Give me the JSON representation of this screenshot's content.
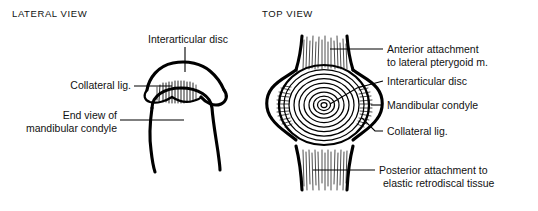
{
  "figure": {
    "background_color": "#ffffff",
    "ink_color": "#000000",
    "width": 538,
    "height": 211
  },
  "panels": [
    {
      "id": "lateral",
      "heading": "LATERAL VIEW",
      "labels": [
        {
          "id": "interarticular-disc",
          "text": "Interarticular disc"
        },
        {
          "id": "collateral-lig",
          "text": "Collateral lig."
        },
        {
          "id": "end-view-line1",
          "text": "End view of"
        },
        {
          "id": "end-view-line2",
          "text": "mandibular condyle"
        }
      ]
    },
    {
      "id": "top",
      "heading": "TOP VIEW",
      "labels": [
        {
          "id": "anterior-attachment-line1",
          "text": "Anterior attachment"
        },
        {
          "id": "anterior-attachment-line2",
          "text": "to lateral pterygoid m."
        },
        {
          "id": "interarticular-disc",
          "text": "Interarticular disc"
        },
        {
          "id": "mandibular-condyle",
          "text": "Mandibular condyle"
        },
        {
          "id": "collateral-lig",
          "text": "Collateral lig."
        },
        {
          "id": "posterior-attachment-line1",
          "text": "Posterior attachment to"
        },
        {
          "id": "posterior-attachment-line2",
          "text": "elastic retrodiscal tissue"
        }
      ]
    }
  ]
}
